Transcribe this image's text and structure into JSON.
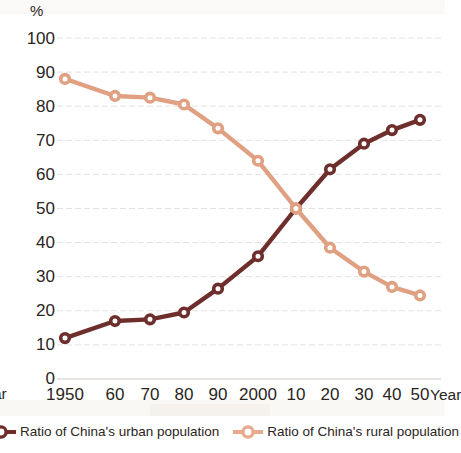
{
  "chart_data": {
    "type": "line",
    "title": "",
    "subtitle": "",
    "xlabel": "Year",
    "ylabel": "%",
    "ylim": [
      0,
      100
    ],
    "ytick_step": 10,
    "grid": true,
    "legend_position": "bottom",
    "categories": [
      "1950",
      "60",
      "70",
      "80",
      "90",
      "2000",
      "10",
      "20",
      "30",
      "40",
      "50"
    ],
    "ytick_labels": [
      "100",
      "90",
      "80",
      "70",
      "60",
      "50",
      "40",
      "30",
      "20",
      "10",
      "0"
    ],
    "ytick_values": [
      100,
      90,
      80,
      70,
      60,
      50,
      40,
      30,
      20,
      10,
      0
    ],
    "series": [
      {
        "name": "Ratio of China's urban population",
        "color": "#6e2f2c",
        "values": [
          12,
          17,
          17.5,
          19.5,
          26.5,
          36,
          50,
          61.5,
          69,
          73,
          76
        ]
      },
      {
        "name": "Ratio of China's rural population",
        "color": "#e0a183",
        "values": [
          88,
          83,
          82.5,
          80.5,
          73.5,
          64,
          50,
          38.5,
          31.5,
          27,
          24.5
        ]
      }
    ]
  },
  "axes": {
    "y_unit_label": "%",
    "x_axis_label_right": "Year",
    "x_axis_label_left_clipped": "ar"
  },
  "legend": {
    "items": [
      {
        "label": "Ratio of China's urban population",
        "color": "#6e2f2c",
        "marker": "circle-outline-marker"
      },
      {
        "label": "Ratio of China's rural population",
        "color": "#e8ab8d",
        "marker": "circle-outline-marker"
      }
    ]
  },
  "colors": {
    "urban": "#6e2f2c",
    "rural": "#e0a183",
    "grid": "#dcd9d4",
    "text": "#2b2522",
    "background": "#ffffff"
  }
}
